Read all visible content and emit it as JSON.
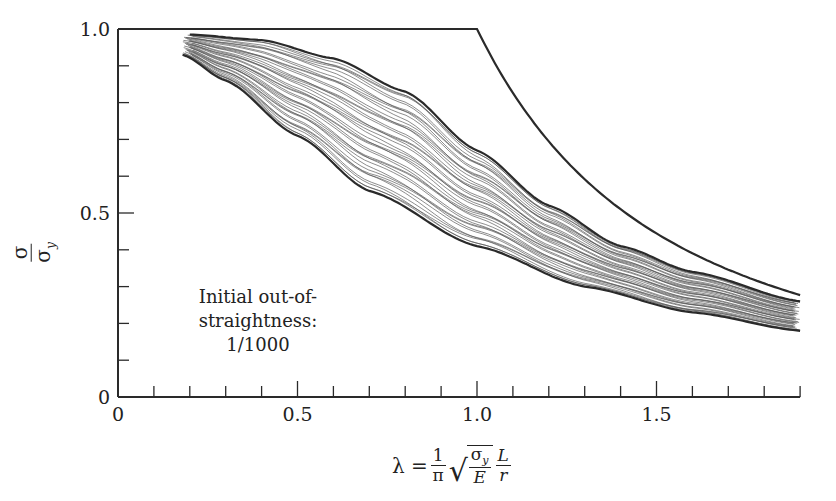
{
  "chart_data": {
    "type": "line",
    "title": "",
    "xlabel": "λ = (1/π) √(σy/E) (L/r)",
    "ylabel": "σ/σy",
    "xlim": [
      0,
      1.9
    ],
    "ylim": [
      0,
      1.0
    ],
    "x_ticks": [
      0,
      0.5,
      1.0,
      1.5
    ],
    "x_tick_labels": [
      "0",
      "0.5",
      "1.0",
      "1.5"
    ],
    "x_minor_step": 0.1,
    "y_ticks": [
      0,
      0.5,
      1.0
    ],
    "y_tick_labels": [
      "0",
      "0.5",
      "1.0"
    ],
    "y_minor_step": 0.1,
    "grid": false,
    "legend": null,
    "annotation": {
      "line1": "Initial out-of-straightness:",
      "line2": "1/1000"
    },
    "series": [
      {
        "name": "Yield / Euler limit",
        "style": "bold",
        "x": [
          0,
          1.0,
          1.05,
          1.1,
          1.2,
          1.3,
          1.4,
          1.5,
          1.6,
          1.7,
          1.8,
          1.9
        ],
        "y": [
          1.0,
          1.0,
          0.907,
          0.826,
          0.694,
          0.592,
          0.51,
          0.444,
          0.391,
          0.346,
          0.309,
          0.277
        ]
      },
      {
        "name": "Upper bound (column strength curves)",
        "style": "bold",
        "x": [
          0.2,
          0.4,
          0.6,
          0.8,
          1.0,
          1.2,
          1.4,
          1.6,
          1.9
        ],
        "y": [
          0.985,
          0.97,
          0.92,
          0.83,
          0.67,
          0.52,
          0.41,
          0.34,
          0.26
        ]
      },
      {
        "name": "Lower bound (column strength curves)",
        "style": "bold",
        "x": [
          0.18,
          0.3,
          0.5,
          0.7,
          1.0,
          1.3,
          1.6,
          1.9
        ],
        "y": [
          0.93,
          0.86,
          0.71,
          0.56,
          0.41,
          0.3,
          0.23,
          0.18
        ]
      },
      {
        "name": "Scatter band (≈40 column curves)",
        "style": "thin-gray",
        "count": 40,
        "x_start_range": [
          0.18,
          0.21
        ],
        "between": [
          "Lower bound (column strength curves)",
          "Upper bound (column strength curves)"
        ]
      }
    ]
  },
  "labels": {
    "y_num": "σ",
    "y_den": "σ",
    "y_den_sub": "y",
    "x_lambda": "λ =",
    "x_frac_num": "1",
    "x_frac_den": "π",
    "x_sqrt_num": "σ",
    "x_sqrt_num_sub": "y",
    "x_sqrt_den": "E",
    "x_lr_num": "L",
    "x_lr_den": "r"
  },
  "colors": {
    "axis": "#2a2a2a",
    "bold_curve": "#2a2a2a",
    "thin_curve": "#555555"
  }
}
